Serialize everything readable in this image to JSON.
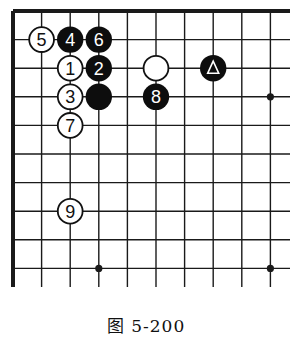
{
  "diagram": {
    "type": "go-board-fragment",
    "corner": "top-left",
    "columns_shown": 10,
    "rows_shown": 10,
    "star_points": [
      [
        3,
        9
      ],
      [
        9,
        9
      ],
      [
        9,
        3
      ]
    ],
    "stones": [
      {
        "color": "white",
        "col": 1,
        "row": 1,
        "label": "5"
      },
      {
        "color": "black",
        "col": 2,
        "row": 1,
        "label": "4"
      },
      {
        "color": "black",
        "col": 3,
        "row": 1,
        "label": "6"
      },
      {
        "color": "white",
        "col": 2,
        "row": 2,
        "label": "1"
      },
      {
        "color": "black",
        "col": 3,
        "row": 2,
        "label": "2"
      },
      {
        "color": "white",
        "col": 5,
        "row": 2,
        "label": ""
      },
      {
        "color": "black",
        "col": 7,
        "row": 2,
        "label": "triangle"
      },
      {
        "color": "white",
        "col": 2,
        "row": 3,
        "label": "3"
      },
      {
        "color": "black",
        "col": 3,
        "row": 3,
        "label": ""
      },
      {
        "color": "black",
        "col": 5,
        "row": 3,
        "label": "8"
      },
      {
        "color": "white",
        "col": 2,
        "row": 4,
        "label": "7"
      },
      {
        "color": "white",
        "col": 2,
        "row": 7,
        "label": "9"
      }
    ],
    "colors": {
      "line": "#1a1a1a",
      "black_stone": "#0d0d0d",
      "white_stone": "#ffffff"
    }
  },
  "caption": "图 5-200"
}
